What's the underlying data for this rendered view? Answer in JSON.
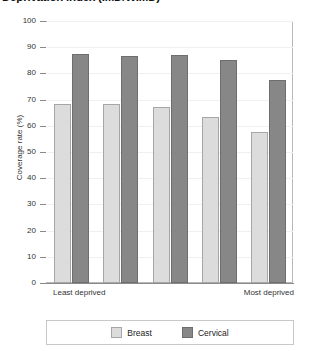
{
  "chart_data": {
    "type": "bar",
    "title": "Deprivation index (IMD/WIMD)",
    "xlabel": "",
    "ylabel": "Coverage rate (%)",
    "ylim": [
      0,
      100
    ],
    "ytick_step": 10,
    "yticks": [
      "100",
      "90",
      "80",
      "70",
      "60",
      "50",
      "40",
      "30",
      "20",
      "10",
      "0"
    ],
    "grid": true,
    "legend_position": "bottom",
    "categories": [
      "Q1",
      "Q2",
      "Q3",
      "Q4",
      "Q5"
    ],
    "x_axis_end_labels": {
      "left": "Least deprived",
      "right": "Most deprived"
    },
    "series": [
      {
        "name": "Breast",
        "color": "#dcdcdc",
        "values": [
          68.5,
          68.5,
          67,
          63.5,
          57.5
        ]
      },
      {
        "name": "Cervical",
        "color": "#878787",
        "values": [
          87.5,
          86.5,
          87,
          85,
          77.5
        ]
      }
    ]
  }
}
